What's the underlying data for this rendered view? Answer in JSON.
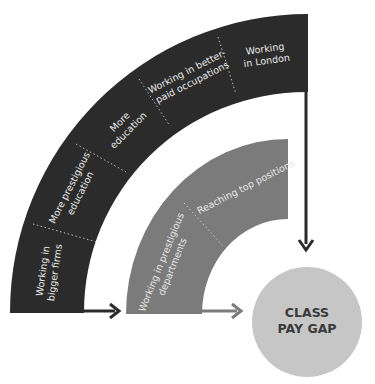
{
  "diagram": {
    "colors": {
      "outer_arc": "#2b2b2b",
      "inner_arc": "#7b7b7b",
      "target_circle": "#c6c6c6",
      "segment_text": "#e8e8e8",
      "circle_text": "#3a3a3a",
      "divider": "#bdbdbd"
    },
    "outer_arc": {
      "segments": [
        {
          "line1": "Working in",
          "line2": "bigger firms"
        },
        {
          "line1": "More prestigious",
          "line2": "education"
        },
        {
          "line1": "More",
          "line2": "education"
        },
        {
          "line1": "Working in better-",
          "line2": "paid occupations"
        },
        {
          "line1": "Working",
          "line2": "in London"
        }
      ]
    },
    "inner_arc": {
      "segments": [
        {
          "line1": "Working in prestigious",
          "line2": "departments"
        },
        {
          "line1": "Reaching top positions",
          "line2": ""
        }
      ]
    },
    "target": {
      "line1": "CLASS",
      "line2": "PAY GAP"
    }
  }
}
